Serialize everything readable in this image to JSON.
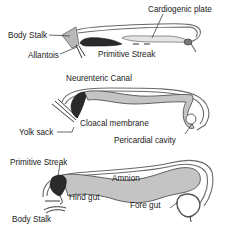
{
  "diagrams": [
    {
      "id": "stage-1",
      "labels": {
        "cardiogenic_plate": "Cardiogenic plate",
        "body_stalk": "Body Stalk",
        "allantois": "Allantois",
        "primitive_streak": "Primitive Streak"
      }
    },
    {
      "id": "stage-2",
      "labels": {
        "neurenteric_canal": "Neurenteric Canal",
        "yolk_sack": "Yolk sack",
        "cloacal_membrane": "Cloacal membrane",
        "pericardial_cavity": "Pericardial cavity"
      }
    },
    {
      "id": "stage-3",
      "labels": {
        "primitive_streak": "Primitive Streak",
        "amnion": "Amnion",
        "hind_gut": "Hind gut",
        "fore_gut": "Fore gut",
        "body_stalk": "Body Stalk"
      }
    }
  ],
  "colors": {
    "gut_fill": "#c4c4c4",
    "streak_fill": "#2a2a2a",
    "outline": "#6a6a6a",
    "text": "#1a1a1a"
  }
}
